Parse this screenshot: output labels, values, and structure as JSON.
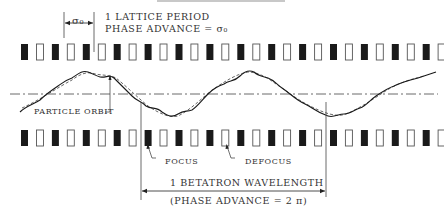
{
  "diagram": {
    "title_bar": "",
    "labels": {
      "sigma_dim": "σ₀",
      "lattice_period_line1": "1 LATTICE PERIOD",
      "lattice_period_line2": "PHASE ADVANCE = σ₀",
      "particle_orbit": "PARTICLE ORBIT",
      "focus": "FOCUS",
      "defocus": "DEFOCUS",
      "betatron_line1": "1 BETATRON WAVELENGTH",
      "betatron_line2": "(PHASE ADVANCE = 2 π)"
    },
    "lattice": {
      "type": "FODO",
      "top_row_count": 28,
      "bottom_row_count": 28,
      "pattern": [
        "focus",
        "defocus"
      ],
      "focus_style": "filled",
      "defocus_style": "hollow"
    },
    "orbit": {
      "curves": [
        "particle orbit (solid, with ripple)",
        "smooth envelope (dashed)"
      ],
      "axis": "dash-dot centerline"
    },
    "colors": {
      "ink": "#1a1a1a",
      "hollow_stroke": "#555555",
      "background": "#ffffff"
    }
  }
}
